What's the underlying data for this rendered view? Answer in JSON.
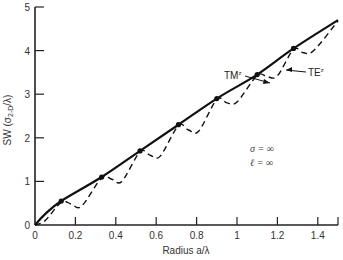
{
  "chart_data": {
    "type": "line",
    "title": "",
    "xlabel": "Radius a/λ",
    "ylabel": "SW (σ2-D/λ)",
    "xlim": [
      0,
      1.5
    ],
    "ylim": [
      0,
      5
    ],
    "grid": false,
    "x_ticks": [
      "0",
      "0.2",
      "0.4",
      "0.6",
      "0.8",
      "1",
      "1.2",
      "1.4"
    ],
    "y_ticks": [
      "0",
      "1",
      "2",
      "3",
      "4",
      "5"
    ],
    "series": [
      {
        "name": "TM^z",
        "style": "solid",
        "x": [
          0,
          0.05,
          0.13,
          0.33,
          0.52,
          0.71,
          0.9,
          1.1,
          1.28,
          1.5
        ],
        "y": [
          0,
          0.25,
          0.55,
          1.1,
          1.7,
          2.3,
          2.9,
          3.45,
          4.05,
          4.7
        ]
      },
      {
        "name": "TE^z",
        "style": "dashed",
        "x": [
          0,
          0.05,
          0.13,
          0.18,
          0.23,
          0.33,
          0.38,
          0.43,
          0.52,
          0.57,
          0.62,
          0.71,
          0.76,
          0.81,
          0.9,
          0.95,
          1.0,
          1.1,
          1.15,
          1.2,
          1.28,
          1.33,
          1.38,
          1.5
        ],
        "y": [
          0,
          0.1,
          0.52,
          0.48,
          0.43,
          1.08,
          1.05,
          1.0,
          1.68,
          1.6,
          1.58,
          2.28,
          2.18,
          2.15,
          2.88,
          2.8,
          2.82,
          3.43,
          3.4,
          3.42,
          4.03,
          3.95,
          4.0,
          4.68
        ]
      }
    ],
    "annotations": [
      {
        "text": "TM^z",
        "x": 0.85,
        "y": 3.3
      },
      {
        "text": "TE^z",
        "x": 1.25,
        "y": 3.4
      },
      {
        "text": "σ = ∞",
        "x": 1.1,
        "y": 1.8
      },
      {
        "text": "ℓ = ∞",
        "x": 1.1,
        "y": 1.4
      }
    ]
  },
  "labels": {
    "xlabel": "Radius a/λ",
    "ylabel": "SW (σ",
    "ylabel_sub": "2-D",
    "ylabel_end": "/λ)",
    "tm": "TM",
    "te": "TE",
    "sup": "z",
    "sigma": "σ = ∞",
    "ell": "ℓ = ∞"
  }
}
